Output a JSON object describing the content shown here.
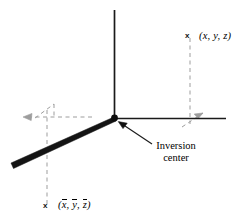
{
  "figure": {
    "background_color": "#ffffff",
    "line_color": "#000000",
    "dashed_color": "#9a9a9a",
    "width": 241,
    "height": 222
  },
  "labels": {
    "upper_point_marker": "x",
    "upper_point_open": "(",
    "upper_point_x": "x",
    "upper_point_sep1": ", ",
    "upper_point_y": "y",
    "upper_point_sep2": ", ",
    "upper_point_z": "z",
    "upper_point_close": ")",
    "lower_point_marker": "x",
    "lower_point_open": "(",
    "lower_point_x": "x",
    "lower_point_sep1": ", ",
    "lower_point_y": "y",
    "lower_point_sep2": ", ",
    "lower_point_z": "z",
    "lower_point_close": ")",
    "inversion_line1": "Inversion",
    "inversion_line2": "center"
  },
  "geometry": {
    "origin_x": 114,
    "origin_y": 118,
    "vertical_axis_top_y": 10,
    "horizontal_axis_right_x": 226,
    "wedge_end_x": 12,
    "wedge_end_y": 166,
    "dashed_right_vertical_x": 190,
    "dashed_right_top_y": 36,
    "dashed_left_vertical_x": 47,
    "dashed_left_bottom_y": 204,
    "dashed_horizontal_left_x": 24,
    "inversion_arrow_from_x": 150,
    "inversion_arrow_from_y": 142,
    "inversion_arrow_to_x": 120,
    "inversion_arrow_to_y": 122
  }
}
